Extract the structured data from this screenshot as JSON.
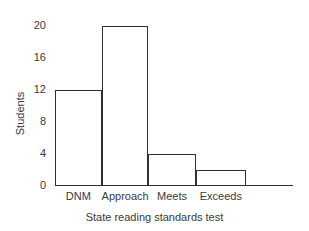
{
  "chart_data": {
    "type": "bar",
    "title": "",
    "subtitle": "",
    "xlabel": "State reading standards test",
    "ylabel": "Students",
    "categories": [
      "DNM",
      "Approach",
      "Meets",
      "Exceeds"
    ],
    "values": [
      12,
      20,
      4,
      2
    ],
    "yticks": [
      0,
      4,
      8,
      12,
      16,
      20
    ],
    "ytick_labels": [
      "0",
      "4",
      "8",
      "12",
      "16",
      "20"
    ],
    "ylim": [
      0,
      20.75
    ],
    "grid": false,
    "legend": false,
    "legend_position": "none",
    "bar_fill_color": "#ffffff",
    "bar_edge_color": "#2f2f2f",
    "axis_color": "#2f2f2f",
    "text_color": "#3a3a3a",
    "background_color": "#ffffff"
  }
}
